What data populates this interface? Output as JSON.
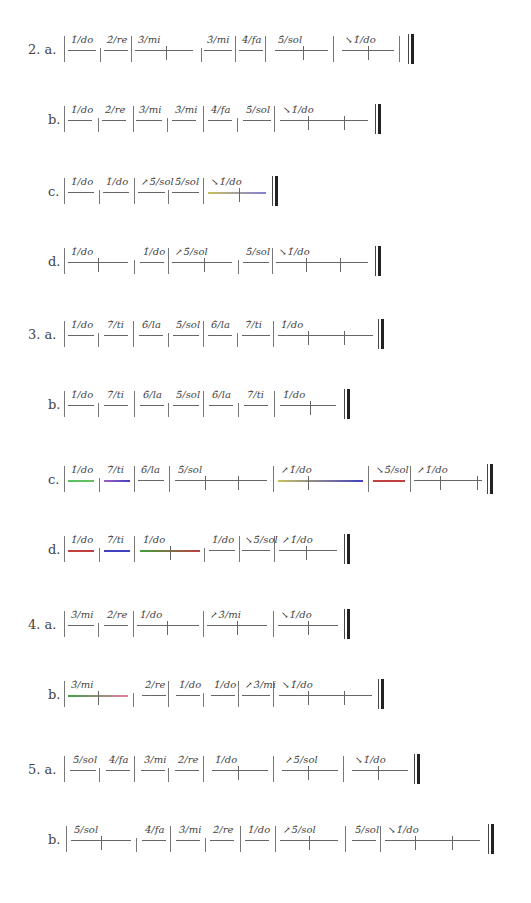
{
  "page": {
    "rows": [
      {
        "label": "2. a.",
        "x": 28,
        "y": 30,
        "barsAt": [
          64,
          100,
          131,
          201,
          235,
          265,
          333,
          399
        ],
        "final": 408,
        "beats": [
          {
            "x": 68,
            "w": 28,
            "text": "1̂/do"
          },
          {
            "x": 104,
            "w": 24,
            "text": "2̂/re"
          },
          {
            "x": 135,
            "w": 58,
            "text": "3̂/mi",
            "ticks": [
              31
            ]
          },
          {
            "x": 204,
            "w": 28,
            "text": "3̂/mi"
          },
          {
            "x": 239,
            "w": 24,
            "text": "4̂/fa"
          },
          {
            "x": 275,
            "w": 53,
            "text": "5̂/sol",
            "ticks": [
              28
            ]
          },
          {
            "x": 342,
            "w": 52,
            "text": "1̂/do",
            "arrow": "↘",
            "ticks": [
              26
            ]
          }
        ]
      },
      {
        "label": "b.",
        "x": 48,
        "y": 100,
        "barsAt": [
          64,
          98,
          133,
          167,
          203,
          237,
          274
        ],
        "final": 375,
        "beats": [
          {
            "x": 68,
            "w": 24,
            "text": "1̂/do"
          },
          {
            "x": 102,
            "w": 24,
            "text": "2̂/re"
          },
          {
            "x": 136,
            "w": 26,
            "text": "3̂/mi"
          },
          {
            "x": 172,
            "w": 24,
            "text": "3̂/mi"
          },
          {
            "x": 208,
            "w": 24,
            "text": "4̂/fa"
          },
          {
            "x": 243,
            "w": 28,
            "text": "5̂/sol"
          },
          {
            "x": 280,
            "w": 88,
            "text": "1̂/do",
            "arrow": "↘",
            "ticks": [
              28,
              64
            ]
          }
        ]
      },
      {
        "label": "c.",
        "x": 48,
        "y": 172,
        "barsAt": [
          64,
          99,
          134,
          168,
          203
        ],
        "final": 272,
        "beats": [
          {
            "x": 68,
            "w": 26,
            "text": "1̂/do"
          },
          {
            "x": 103,
            "w": 26,
            "text": "1̂/do"
          },
          {
            "x": 138,
            "w": 27,
            "text": "5̂/sol",
            "arrow": "↗"
          },
          {
            "x": 172,
            "w": 27,
            "text": "5̂/sol"
          },
          {
            "x": 208,
            "w": 58,
            "text": "1̂/do",
            "arrow": "↘",
            "ticks": [
              31
            ],
            "colors": [
              "#c8c060",
              "#8080d8"
            ]
          }
        ]
      },
      {
        "label": "d.",
        "x": 48,
        "y": 242,
        "barsAt": [
          64,
          134,
          168,
          238,
          272
        ],
        "final": 375,
        "beats": [
          {
            "x": 68,
            "w": 60,
            "text": "1̂/do",
            "ticks": [
              30
            ]
          },
          {
            "x": 140,
            "w": 24,
            "text": "1̂/do"
          },
          {
            "x": 172,
            "w": 60,
            "text": "5̂/sol",
            "arrow": "↗",
            "ticks": [
              32
            ]
          },
          {
            "x": 243,
            "w": 26,
            "text": "5̂/sol"
          },
          {
            "x": 276,
            "w": 92,
            "text": "1̂/do",
            "arrow": "↘",
            "ticks": [
              30,
              64
            ]
          }
        ]
      },
      {
        "label": "3. a.",
        "x": 28,
        "y": 315,
        "barsAt": [
          64,
          98,
          133,
          168,
          203,
          237,
          273
        ],
        "final": 378,
        "beats": [
          {
            "x": 68,
            "w": 26,
            "text": "1̂/do"
          },
          {
            "x": 104,
            "w": 24,
            "text": "7̂/ti"
          },
          {
            "x": 139,
            "w": 24,
            "text": "6̂/la"
          },
          {
            "x": 173,
            "w": 26,
            "text": "5̂/sol"
          },
          {
            "x": 208,
            "w": 24,
            "text": "6̂/la"
          },
          {
            "x": 242,
            "w": 28,
            "text": "7̂/ti"
          },
          {
            "x": 278,
            "w": 95,
            "text": "1̂/do",
            "ticks": [
              30,
              66
            ]
          }
        ]
      },
      {
        "label": "b.",
        "x": 48,
        "y": 385,
        "barsAt": [
          64,
          98,
          134,
          168,
          203,
          238,
          274
        ],
        "final": 344,
        "beats": [
          {
            "x": 68,
            "w": 26,
            "text": "1̂/do"
          },
          {
            "x": 104,
            "w": 24,
            "text": "7̂/ti"
          },
          {
            "x": 140,
            "w": 24,
            "text": "6̂/la"
          },
          {
            "x": 173,
            "w": 26,
            "text": "5̂/sol"
          },
          {
            "x": 209,
            "w": 24,
            "text": "6̂/la"
          },
          {
            "x": 244,
            "w": 24,
            "text": "7̂/ti"
          },
          {
            "x": 280,
            "w": 56,
            "text": "1̂/do",
            "ticks": [
              30
            ]
          }
        ]
      },
      {
        "label": "c.",
        "x": 48,
        "y": 460,
        "blue": true,
        "barsAt": [
          64,
          99,
          134,
          169,
          273,
          368,
          410
        ],
        "final": 487,
        "beats": [
          {
            "x": 68,
            "w": 26,
            "text": "1̂/do",
            "colors": [
              "#60c060",
              "#60c060"
            ]
          },
          {
            "x": 104,
            "w": 26,
            "text": "7̂/ti",
            "colors": [
              "#a060c0",
              "#4040c0"
            ]
          },
          {
            "x": 138,
            "w": 26,
            "text": "6̂/la"
          },
          {
            "x": 175,
            "w": 92,
            "text": "5̂/sol",
            "ticks": [
              30,
              63
            ]
          },
          {
            "x": 278,
            "w": 85,
            "text": "1̂/do",
            "arrow": "↗",
            "ticks": [
              30
            ],
            "colors": [
              "#c8c060",
              "#4040c0"
            ]
          },
          {
            "x": 373,
            "w": 32,
            "text": "5̂/sol",
            "arrow": "↘",
            "colors": [
              "#c04040",
              "#c04040"
            ]
          },
          {
            "x": 414,
            "w": 68,
            "text": "1̂/do",
            "arrow": "↗",
            "ticks": [
              26,
              63
            ]
          }
        ]
      },
      {
        "label": "d.",
        "x": 48,
        "y": 530,
        "barsAt": [
          64,
          99,
          134,
          204,
          239,
          274
        ],
        "final": 344,
        "beats": [
          {
            "x": 68,
            "w": 26,
            "text": "1̂/do",
            "colors": [
              "#c04040",
              "#c04040"
            ]
          },
          {
            "x": 104,
            "w": 26,
            "text": "7̂/ti",
            "colors": [
              "#4040c0",
              "#4040c0"
            ]
          },
          {
            "x": 140,
            "w": 60,
            "text": "1̂/do",
            "ticks": [
              30
            ],
            "colors": [
              "#40a040",
              "#c04040"
            ]
          },
          {
            "x": 209,
            "w": 26,
            "text": "1̂/do"
          },
          {
            "x": 242,
            "w": 28,
            "text": "5̂/sol",
            "arrow": "↘"
          },
          {
            "x": 279,
            "w": 58,
            "text": "1̂/do",
            "arrow": "↗",
            "ticks": [
              27
            ]
          }
        ]
      },
      {
        "label": "4. a.",
        "x": 28,
        "y": 605,
        "barsAt": [
          64,
          98,
          133,
          203,
          273
        ],
        "final": 344,
        "beats": [
          {
            "x": 68,
            "w": 26,
            "text": "3̂/mi"
          },
          {
            "x": 104,
            "w": 24,
            "text": "2̂/re"
          },
          {
            "x": 137,
            "w": 62,
            "text": "1̂/do",
            "ticks": [
              30
            ]
          },
          {
            "x": 207,
            "w": 60,
            "text": "3̂/mi",
            "arrow": "↗",
            "ticks": [
              30
            ]
          },
          {
            "x": 278,
            "w": 60,
            "text": "1̂/do",
            "arrow": "↘",
            "ticks": [
              30
            ]
          }
        ]
      },
      {
        "label": "b.",
        "x": 48,
        "y": 675,
        "barsAt": [
          64,
          133,
          168,
          203,
          238,
          273
        ],
        "final": 378,
        "beats": [
          {
            "x": 68,
            "w": 60,
            "text": "3̂/mi",
            "ticks": [
              30
            ],
            "colors": [
              "#40a040",
              "#e080a0"
            ]
          },
          {
            "x": 142,
            "w": 24,
            "text": "2̂/re"
          },
          {
            "x": 176,
            "w": 24,
            "text": "1̂/do"
          },
          {
            "x": 211,
            "w": 24,
            "text": "1̂/do"
          },
          {
            "x": 242,
            "w": 28,
            "text": "3̂/mi",
            "arrow": "↗"
          },
          {
            "x": 279,
            "w": 93,
            "text": "1̂/do",
            "arrow": "↘",
            "ticks": [
              29,
              65
            ]
          }
        ]
      },
      {
        "label": "5. a.",
        "x": 28,
        "y": 750,
        "barsAt": [
          64,
          99,
          134,
          168,
          203,
          273,
          343
        ],
        "final": 414,
        "beats": [
          {
            "x": 70,
            "w": 26,
            "text": "5̂/sol"
          },
          {
            "x": 106,
            "w": 24,
            "text": "4̂/fa"
          },
          {
            "x": 141,
            "w": 24,
            "text": "3̂/mi"
          },
          {
            "x": 175,
            "w": 24,
            "text": "2̂/re"
          },
          {
            "x": 212,
            "w": 56,
            "text": "1̂/do",
            "ticks": [
              26
            ]
          },
          {
            "x": 282,
            "w": 56,
            "text": "5̂/sol",
            "arrow": "↗",
            "ticks": [
              26
            ]
          },
          {
            "x": 352,
            "w": 56,
            "text": "1̂/do",
            "arrow": "↘",
            "ticks": [
              26
            ]
          }
        ]
      },
      {
        "label": "b.",
        "x": 48,
        "y": 820,
        "barsAt": [
          66,
          136,
          170,
          205,
          240,
          275,
          345,
          380
        ],
        "final": 488,
        "beats": [
          {
            "x": 71,
            "w": 60,
            "text": "5̂/sol",
            "ticks": [
              30
            ]
          },
          {
            "x": 142,
            "w": 24,
            "text": "4̂/fa"
          },
          {
            "x": 176,
            "w": 24,
            "text": "3̂/mi"
          },
          {
            "x": 210,
            "w": 24,
            "text": "2̂/re"
          },
          {
            "x": 245,
            "w": 24,
            "text": "1̂/do"
          },
          {
            "x": 280,
            "w": 58,
            "text": "5̂/sol",
            "arrow": "↗",
            "ticks": [
              29
            ]
          },
          {
            "x": 352,
            "w": 24,
            "text": "5̂/sol"
          },
          {
            "x": 385,
            "w": 95,
            "text": "1̂/do",
            "arrow": "↘",
            "ticks": [
              30,
              67
            ]
          }
        ]
      }
    ]
  }
}
